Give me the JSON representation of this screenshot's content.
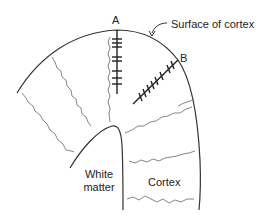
{
  "labels": {
    "probe_a": "A",
    "probe_b": "B",
    "surface": "Surface of cortex",
    "white_matter_line1": "White",
    "white_matter_line2": "matter",
    "cortex": "Cortex"
  },
  "colors": {
    "stroke": "#333333",
    "wavy": "#666666",
    "text": "#222222",
    "background": "#ffffff"
  },
  "diagram": {
    "probes": [
      {
        "id": "A",
        "orientation": "perpendicular to surface",
        "tick_count": 8
      },
      {
        "id": "B",
        "orientation": "oblique to surface",
        "tick_count": 9
      }
    ],
    "regions": [
      "Surface of cortex",
      "White matter",
      "Cortex"
    ]
  }
}
